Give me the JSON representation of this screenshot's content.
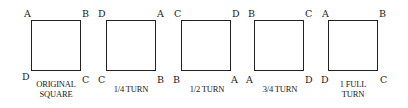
{
  "diagram": {
    "panels": [
      {
        "id": "original",
        "corners": {
          "top_left": "A",
          "top_right": "B",
          "bottom_right": "C",
          "bottom_left": "D"
        },
        "caption_line1": "ORIGINAL",
        "caption_line2": "SQUARE"
      },
      {
        "id": "quarter",
        "corners": {
          "top_left": "D",
          "top_right": "A",
          "bottom_right": "B",
          "bottom_left": "C"
        },
        "caption_line1": "1/4 TURN",
        "caption_line2": ""
      },
      {
        "id": "half",
        "corners": {
          "top_left": "C",
          "top_right": "D",
          "bottom_right": "A",
          "bottom_left": "B"
        },
        "caption_line1": "1/2 TURN",
        "caption_line2": ""
      },
      {
        "id": "three-quarter",
        "corners": {
          "top_left": "B",
          "top_right": "C",
          "bottom_right": "D",
          "bottom_left": "A"
        },
        "caption_line1": "3/4 TURN",
        "caption_line2": ""
      },
      {
        "id": "full",
        "corners": {
          "top_left": "A",
          "top_right": "B",
          "bottom_right": "C",
          "bottom_left": "D"
        },
        "caption_line1": "1 FULL",
        "caption_line2": "TURN"
      }
    ]
  }
}
